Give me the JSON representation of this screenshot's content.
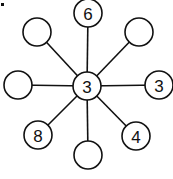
{
  "diagram": {
    "type": "star-graph",
    "center": {
      "id": "center",
      "label": "3"
    },
    "spokes": [
      {
        "id": "top",
        "label": "6"
      },
      {
        "id": "top-right",
        "label": ""
      },
      {
        "id": "right",
        "label": "3"
      },
      {
        "id": "bottom-right",
        "label": "4"
      },
      {
        "id": "bottom",
        "label": ""
      },
      {
        "id": "bottom-left",
        "label": "8"
      },
      {
        "id": "left",
        "label": ""
      },
      {
        "id": "top-left",
        "label": ""
      }
    ]
  }
}
